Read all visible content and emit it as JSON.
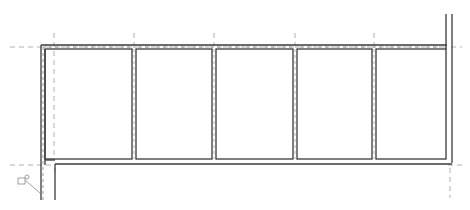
{
  "view": {
    "type": "floor-plan",
    "width": 470,
    "height": 210,
    "background": "#ffffff",
    "wall_color": "#3a3a3a",
    "grid_color": "#9a9a9a"
  },
  "rooms": [
    {
      "id": "room-1",
      "x": 45,
      "y": 49,
      "w": 87,
      "h": 110
    },
    {
      "id": "room-2",
      "x": 136,
      "y": 49,
      "w": 76,
      "h": 110
    },
    {
      "id": "room-3",
      "x": 216,
      "y": 49,
      "w": 77,
      "h": 110
    },
    {
      "id": "room-4",
      "x": 297,
      "y": 49,
      "w": 75,
      "h": 110
    },
    {
      "id": "room-5",
      "x": 376,
      "y": 49,
      "w": 68,
      "h": 110
    }
  ],
  "grid_lines": {
    "horizontal": [
      47,
      165
    ],
    "vertical": [
      54,
      134,
      214,
      295,
      374,
      450
    ]
  },
  "annotation": {
    "icon": "reference-tag-icon"
  }
}
